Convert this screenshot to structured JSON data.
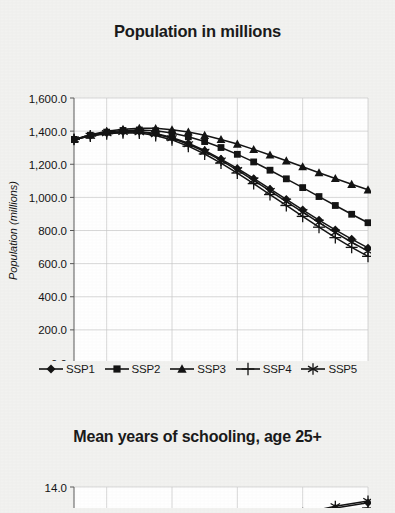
{
  "background_color": "#f2f2f0",
  "ink_color": "#141414",
  "grid_color": "#c9c9c9",
  "charts": [
    {
      "id": "population",
      "title": "Population in millions",
      "ylabel": "Population (millions)",
      "xlabel": ""
    },
    {
      "id": "schooling",
      "title": "Mean years of schooling, age 25+",
      "ylabel": "",
      "xlabel": ""
    }
  ],
  "legend": {
    "items": [
      {
        "label": "SSP1",
        "marker": "diamond"
      },
      {
        "label": "SSP2",
        "marker": "square"
      },
      {
        "label": "SSP3",
        "marker": "triangle"
      },
      {
        "label": "SSP4",
        "marker": "plus"
      },
      {
        "label": "SSP5",
        "marker": "asterisk"
      }
    ]
  },
  "chart_data": [
    {
      "type": "line",
      "title": "Population in millions",
      "xlabel": "",
      "ylabel": "Population (millions)",
      "x": [
        2010,
        2015,
        2020,
        2025,
        2030,
        2035,
        2040,
        2045,
        2050,
        2055,
        2060,
        2065,
        2070,
        2075,
        2080,
        2085,
        2090,
        2095,
        2100
      ],
      "xlim": [
        2010,
        2100
      ],
      "ylim": [
        0,
        1600
      ],
      "yticks": [
        "0.0",
        "200.0",
        "400.0",
        "600.0",
        "800.0",
        "1,000.0",
        "1,200.0",
        "1,400.0",
        "1,600.0"
      ],
      "xticks": [
        "2010",
        "2020",
        "2030",
        "2040",
        "2050",
        "2060",
        "2070",
        "2080",
        "2090",
        "2100"
      ],
      "grid": true,
      "legend_position": "bottom",
      "series": [
        {
          "name": "SSP1",
          "marker": "diamond",
          "values": [
            1350,
            1372,
            1388,
            1396,
            1397,
            1386,
            1362,
            1327,
            1283,
            1231,
            1175,
            1114,
            1051,
            988,
            925,
            863,
            804,
            748,
            695
          ]
        },
        {
          "name": "SSP2",
          "marker": "square",
          "values": [
            1350,
            1375,
            1394,
            1404,
            1407,
            1402,
            1388,
            1366,
            1337,
            1301,
            1260,
            1214,
            1164,
            1112,
            1059,
            1005,
            951,
            898,
            847
          ]
        },
        {
          "name": "SSP3",
          "marker": "triangle",
          "values": [
            1350,
            1378,
            1399,
            1412,
            1418,
            1417,
            1409,
            1395,
            1375,
            1350,
            1322,
            1290,
            1256,
            1221,
            1185,
            1149,
            1114,
            1079,
            1046
          ]
        },
        {
          "name": "SSP4",
          "marker": "plus",
          "values": [
            1350,
            1370,
            1384,
            1390,
            1388,
            1374,
            1347,
            1309,
            1262,
            1207,
            1147,
            1083,
            1017,
            951,
            885,
            820,
            757,
            698,
            644
          ]
        },
        {
          "name": "SSP5",
          "marker": "asterisk",
          "values": [
            1350,
            1372,
            1388,
            1395,
            1394,
            1382,
            1357,
            1321,
            1276,
            1223,
            1165,
            1103,
            1039,
            975,
            911,
            848,
            787,
            729,
            675
          ]
        }
      ]
    },
    {
      "type": "line",
      "title": "Mean years of schooling, age 25+",
      "xlabel": "",
      "ylabel": "",
      "x": [
        2010,
        2020,
        2030,
        2040,
        2050,
        2060,
        2070,
        2080,
        2090,
        2100
      ],
      "xlim": [
        2010,
        2100
      ],
      "ylim": [
        10.5,
        14.0
      ],
      "yticks": [
        "12.0",
        "14.0"
      ],
      "grid": true,
      "note": "chart is cropped by the bottom edge of the screenshot; only the upper portion is visible",
      "series": [
        {
          "name": "SSP1",
          "marker": "diamond",
          "values": [
            null,
            null,
            null,
            null,
            null,
            11.6,
            12.0,
            12.4,
            12.8,
            13.1
          ]
        },
        {
          "name": "SSP2",
          "marker": "square",
          "values": [
            null,
            null,
            null,
            null,
            null,
            11.3,
            11.6,
            11.9,
            12.2,
            12.4
          ]
        },
        {
          "name": "SSP3",
          "marker": "triangle",
          "values": [
            null,
            null,
            null,
            null,
            null,
            11.2,
            11.5,
            11.8,
            12.0,
            12.2
          ]
        },
        {
          "name": "SSP4",
          "marker": "plus",
          "values": [
            null,
            null,
            null,
            null,
            null,
            11.4,
            11.8,
            12.1,
            12.5,
            12.8
          ]
        },
        {
          "name": "SSP5",
          "marker": "asterisk",
          "values": [
            null,
            null,
            null,
            null,
            null,
            11.7,
            12.1,
            12.5,
            12.9,
            13.2
          ]
        }
      ]
    }
  ]
}
